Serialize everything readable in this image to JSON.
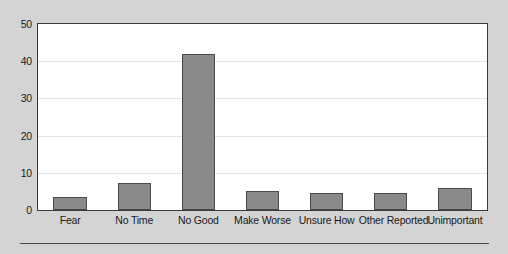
{
  "chart_data": {
    "type": "bar",
    "title": "",
    "subtitle": "",
    "xlabel": "",
    "ylabel": "",
    "categories": [
      "Fear",
      "No Time",
      "No Good",
      "Make Worse",
      "Unsure How",
      "Other Reported",
      "Unimportant"
    ],
    "values": [
      3.5,
      7.3,
      42,
      5.0,
      4.5,
      4.5,
      5.8
    ],
    "ylim": [
      0,
      50
    ],
    "yticks": [
      0,
      10,
      20,
      30,
      40,
      50
    ],
    "ytick_labels": [
      "0",
      "10",
      "20",
      "30",
      "40",
      "50"
    ],
    "grid": true,
    "grid_axis": "y",
    "legend": false,
    "legend_position": "none",
    "annotations": [],
    "colors": {
      "bar_fill": "#8a8a8a",
      "bar_edge": "#4a4a4a",
      "plot_background": "#ffffff",
      "page_background": "#d4d4d4",
      "gridline": "#e2e2e2",
      "frame": "#3a3a3a",
      "text": "#1a1a1a",
      "rule": "#4a4a4a"
    }
  }
}
